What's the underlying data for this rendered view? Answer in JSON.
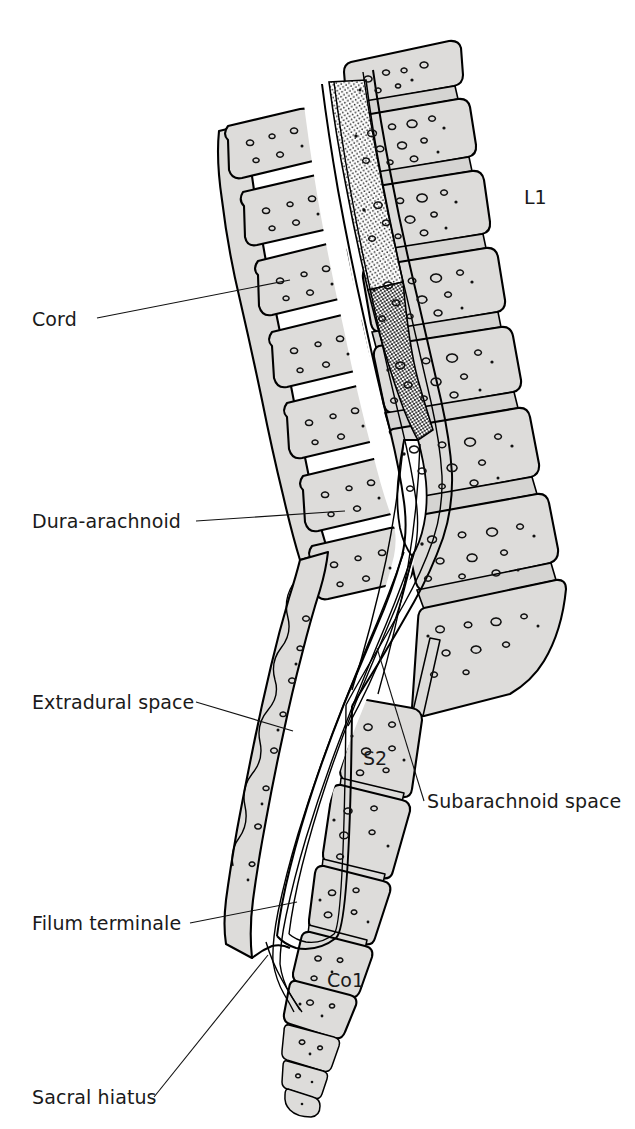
{
  "figure": {
    "background_color": "#ffffff",
    "bone_fill_color": "#dddcda",
    "outline_color": "#000000",
    "text_color": "#1a1a1a",
    "width": 635,
    "height": 1129
  },
  "labels": {
    "cord": "Cord",
    "dura_arachnoid": "Dura-arachnoid",
    "extradural_space": "Extradural space",
    "filum_terminale": "Filum terminale",
    "sacral_hiatus": "Sacral hiatus",
    "subarachnoid_space": "Subarachnoid space",
    "l1": "L1",
    "s2": "S2",
    "co1": "Co1"
  },
  "annotations": [
    {
      "id": "cord",
      "text": "Cord",
      "text_x": 32,
      "text_y": 326,
      "anchor": "start",
      "leader": "M 97,318 L 290,280",
      "side": "left"
    },
    {
      "id": "dura-arachnoid",
      "text": "Dura-arachnoid",
      "text_x": 32,
      "text_y": 528,
      "anchor": "start",
      "leader": "M 196,521 L 345,511",
      "side": "left"
    },
    {
      "id": "extradural-space",
      "text": "Extradural space",
      "text_x": 32,
      "text_y": 709,
      "anchor": "start",
      "leader": "M 196,702 L 293,731",
      "side": "left"
    },
    {
      "id": "filum-terminale",
      "text": "Filum terminale",
      "text_x": 32,
      "text_y": 930,
      "anchor": "start",
      "leader": "M 190,923 L 297,902",
      "side": "left"
    },
    {
      "id": "sacral-hiatus",
      "text": "Sacral hiatus",
      "text_x": 32,
      "text_y": 1104,
      "anchor": "start",
      "leader": "M 154,1097 L 268,955",
      "side": "left"
    },
    {
      "id": "subarachnoid-space",
      "text": "Subarachnoid space",
      "text_x": 427,
      "text_y": 808,
      "anchor": "start",
      "leader": "M 424,801 L 377,648",
      "side": "right"
    }
  ],
  "vertebra_labels": [
    {
      "id": "l1",
      "text": "L1",
      "x": 524,
      "y": 204
    },
    {
      "id": "s2",
      "text": "S2",
      "x": 363,
      "y": 765
    },
    {
      "id": "co1",
      "text": "Co1",
      "x": 327,
      "y": 987
    }
  ],
  "anatomy_parts": [
    "spinal-cord",
    "conus-medullaris",
    "cauda-equina",
    "dural-sac",
    "subarachnoid-space",
    "extradural-space",
    "filum-terminale",
    "lumbar-vertebral-bodies",
    "intervertebral-discs",
    "spinous-processes",
    "sacrum",
    "sacral-hiatus",
    "coccyx"
  ]
}
